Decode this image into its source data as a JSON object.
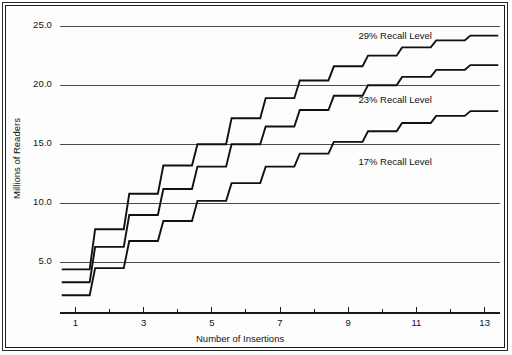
{
  "chart_data": {
    "type": "line",
    "subtype": "step",
    "title": "",
    "xlabel": "Number of Insertions",
    "ylabel": "Millions of Readers",
    "xlim": [
      0.55,
      13.45
    ],
    "ylim": [
      0.7,
      26.2
    ],
    "xticks": [
      1,
      2,
      3,
      4,
      5,
      6,
      7,
      8,
      9,
      10,
      11,
      12,
      13
    ],
    "xtick_labels": [
      "1",
      "",
      "3",
      "",
      "5",
      "",
      "7",
      "",
      "9",
      "",
      "11",
      "",
      "13"
    ],
    "yticks": [
      5.0,
      10.0,
      15.0,
      20.0,
      25.0
    ],
    "ytick_labels": [
      "5.0",
      "10.0",
      "15.0",
      "20.0",
      "25.0"
    ],
    "grid": "horizontal",
    "legend_position": "inline-annotations",
    "x": [
      1,
      2,
      3,
      4,
      5,
      6,
      7,
      8,
      9,
      10,
      11,
      12,
      13
    ],
    "series": [
      {
        "name": "29% Recall Level",
        "annotation": "29% Recall Level",
        "values": [
          4.4,
          7.8,
          10.8,
          13.2,
          15.0,
          17.2,
          18.9,
          20.4,
          21.6,
          22.5,
          23.2,
          23.8,
          24.2
        ]
      },
      {
        "name": "23% Recall Level",
        "annotation": "23% Recall Level",
        "values": [
          3.3,
          6.3,
          9.0,
          11.2,
          13.1,
          15.0,
          16.5,
          17.9,
          19.1,
          20.0,
          20.7,
          21.3,
          21.7
        ]
      },
      {
        "name": "17% Recall Level",
        "annotation": "17% Recall Level",
        "values": [
          2.2,
          4.5,
          6.8,
          8.5,
          10.2,
          11.7,
          13.1,
          14.2,
          15.2,
          16.1,
          16.8,
          17.4,
          17.8
        ]
      }
    ],
    "annotations": [
      {
        "text": "29% Recall Level",
        "x": 9.3,
        "y": 24.1
      },
      {
        "text": "23% Recall Level",
        "x": 9.3,
        "y": 18.7
      },
      {
        "text": "17% Recall Level",
        "x": 9.3,
        "y": 13.4
      }
    ],
    "colors": {
      "series_line": "#111111",
      "gridline": "#4a4a4a",
      "axis": "#1b1b1b",
      "frame": "#2a2a2a",
      "background": "#fdfdfd"
    }
  }
}
